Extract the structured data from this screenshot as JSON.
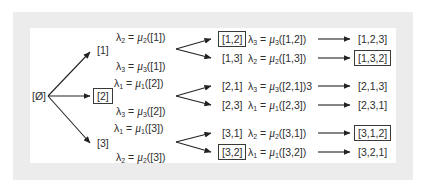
{
  "diagram": {
    "title": "",
    "colors": {
      "frame": "#ececec",
      "background": "#ffffff",
      "text": "#2e2e2e",
      "arrow": "#222222"
    },
    "root": {
      "label": "[Ø]"
    },
    "level1": [
      {
        "label": "[1]",
        "boxed": false
      },
      {
        "label": "[2]",
        "boxed": true
      },
      {
        "label": "[3]",
        "boxed": false
      }
    ],
    "level1_annotations": [
      {
        "lam": "λ",
        "lam_sub": "2",
        "eq": " = ",
        "mu": "μ",
        "mu_sub": "2",
        "arg": "([1])"
      },
      {
        "lam": "λ",
        "lam_sub": "3",
        "eq": " = ",
        "mu": "μ",
        "mu_sub": "3",
        "arg": "([1])"
      },
      {
        "lam": "λ",
        "lam_sub": "1",
        "eq": " = ",
        "mu": "μ",
        "mu_sub": "1",
        "arg": "([2])"
      },
      {
        "lam": "λ",
        "lam_sub": "3",
        "eq": " = ",
        "mu": "μ",
        "mu_sub": "3",
        "arg": "([2])"
      },
      {
        "lam": "λ",
        "lam_sub": "1",
        "eq": " = ",
        "mu": "μ",
        "mu_sub": "1",
        "arg": "([3])"
      },
      {
        "lam": "λ",
        "lam_sub": "2",
        "eq": " = ",
        "mu": "μ",
        "mu_sub": "2",
        "arg": "([3])"
      }
    ],
    "level2": [
      {
        "label": "[1,2]",
        "boxed": true,
        "lam": "λ",
        "lam_sub": "3",
        "eq": " = ",
        "mu": "μ",
        "mu_sub": "3",
        "arg": "([1,2])",
        "result": "[1,2,3]",
        "result_boxed": false
      },
      {
        "label": "[1,3]",
        "boxed": false,
        "lam": "λ",
        "lam_sub": "2",
        "eq": " = ",
        "mu": "μ",
        "mu_sub": "2",
        "arg": "([1,3])",
        "result": "[1,3,2]",
        "result_boxed": true
      },
      {
        "label": "[2,1]",
        "boxed": false,
        "lam": "λ",
        "lam_sub": "3",
        "eq": " = ",
        "mu": "μ",
        "mu_sub": "3",
        "arg": "([2,1])3",
        "result": "[2,1,3]",
        "result_boxed": false
      },
      {
        "label": "[2,3]",
        "boxed": false,
        "lam": "λ",
        "lam_sub": "1",
        "eq": " = ",
        "mu": "μ",
        "mu_sub": "1",
        "arg": "([2,3])",
        "result": "[2,3,1]",
        "result_boxed": false
      },
      {
        "label": "[3,1]",
        "boxed": false,
        "lam": "λ",
        "lam_sub": "2",
        "eq": " = ",
        "mu": "μ",
        "mu_sub": "2",
        "arg": "([3,1])",
        "result": "[3,1,2]",
        "result_boxed": true
      },
      {
        "label": "[3,2]",
        "boxed": true,
        "lam": "λ",
        "lam_sub": "1",
        "eq": " = ",
        "mu": "μ",
        "mu_sub": "1",
        "arg": "([3,2])",
        "result": "[3,2,1]",
        "result_boxed": false
      }
    ]
  }
}
